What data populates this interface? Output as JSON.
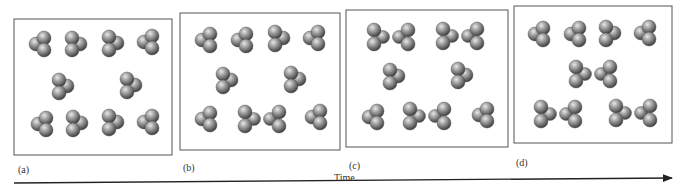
{
  "figure": {
    "time_axis_label": "Time",
    "colors": {
      "sphere_light": "#d9d9d9",
      "sphere_mid": "#8a8a8a",
      "sphere_dark": "#3c3c3c",
      "box_border": "#555555",
      "arrow": "#222222"
    },
    "panels": [
      {
        "label": "(a)",
        "box": {
          "x": 14,
          "y": 19,
          "w": 158,
          "h": 136
        },
        "label_pos": {
          "x": 18,
          "y": 164
        },
        "molecules": [
          {
            "type": "monomer",
            "x": 40,
            "y": 44,
            "variant": "L"
          },
          {
            "type": "monomer",
            "x": 76,
            "y": 44,
            "variant": "R"
          },
          {
            "type": "monomer",
            "x": 112,
            "y": 43,
            "variant": "R2"
          },
          {
            "type": "monomer",
            "x": 148,
            "y": 42,
            "variant": "L"
          },
          {
            "type": "monomer",
            "x": 62,
            "y": 86,
            "variant": "R2"
          },
          {
            "type": "monomer",
            "x": 130,
            "y": 85,
            "variant": "R2"
          },
          {
            "type": "monomer",
            "x": 42,
            "y": 124,
            "variant": "L"
          },
          {
            "type": "monomer",
            "x": 76,
            "y": 123,
            "variant": "R2"
          },
          {
            "type": "monomer",
            "x": 112,
            "y": 122,
            "variant": "R2"
          },
          {
            "type": "monomer",
            "x": 148,
            "y": 122,
            "variant": "L"
          }
        ]
      },
      {
        "label": "(b)",
        "box": {
          "x": 180,
          "y": 13,
          "w": 160,
          "h": 137
        },
        "label_pos": {
          "x": 183,
          "y": 162
        },
        "molecules": [
          {
            "type": "monomer",
            "x": 206,
            "y": 40,
            "variant": "L"
          },
          {
            "type": "monomer",
            "x": 242,
            "y": 40,
            "variant": "L"
          },
          {
            "type": "monomer",
            "x": 278,
            "y": 38,
            "variant": "R2"
          },
          {
            "type": "monomer",
            "x": 314,
            "y": 38,
            "variant": "L"
          },
          {
            "type": "monomer",
            "x": 226,
            "y": 80,
            "variant": "R2"
          },
          {
            "type": "monomer",
            "x": 294,
            "y": 79,
            "variant": "R2"
          },
          {
            "type": "monomer",
            "x": 206,
            "y": 119,
            "variant": "L"
          },
          {
            "type": "dimer",
            "x": 262,
            "y": 119
          },
          {
            "type": "monomer",
            "x": 316,
            "y": 117,
            "variant": "L"
          }
        ]
      },
      {
        "label": "(c)",
        "box": {
          "x": 346,
          "y": 10,
          "w": 162,
          "h": 137
        },
        "label_pos": {
          "x": 349,
          "y": 160
        },
        "molecules": [
          {
            "type": "dimer",
            "x": 391,
            "y": 37
          },
          {
            "type": "dimer",
            "x": 460,
            "y": 36
          },
          {
            "type": "monomer",
            "x": 393,
            "y": 76,
            "variant": "R2"
          },
          {
            "type": "monomer",
            "x": 461,
            "y": 75,
            "variant": "R2"
          },
          {
            "type": "monomer",
            "x": 373,
            "y": 117,
            "variant": "L"
          },
          {
            "type": "dimer",
            "x": 427,
            "y": 116
          },
          {
            "type": "monomer",
            "x": 483,
            "y": 115,
            "variant": "L"
          }
        ]
      },
      {
        "label": "(d)",
        "box": {
          "x": 514,
          "y": 6,
          "w": 158,
          "h": 137
        },
        "label_pos": {
          "x": 516,
          "y": 157
        },
        "molecules": [
          {
            "type": "monomer",
            "x": 539,
            "y": 34,
            "variant": "L"
          },
          {
            "type": "monomer",
            "x": 575,
            "y": 34,
            "variant": "L"
          },
          {
            "type": "monomer",
            "x": 609,
            "y": 33,
            "variant": "R2"
          },
          {
            "type": "monomer",
            "x": 645,
            "y": 33,
            "variant": "L"
          },
          {
            "type": "dimer",
            "x": 593,
            "y": 74
          },
          {
            "type": "dimer",
            "x": 558,
            "y": 114
          },
          {
            "type": "dimer",
            "x": 633,
            "y": 113
          }
        ]
      }
    ],
    "time_label_pos": {
      "x": 334,
      "y": 172
    },
    "arrow": {
      "x1": 14,
      "y1": 183,
      "x2": 672,
      "y2": 178
    }
  }
}
